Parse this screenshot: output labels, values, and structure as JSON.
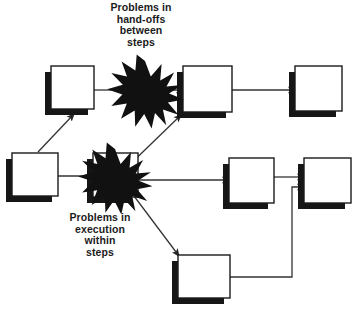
{
  "diagram": {
    "canvas": {
      "width": 359,
      "height": 312,
      "background": "#ffffff"
    },
    "style": {
      "box_fill": "#ffffff",
      "box_stroke": "#1a1a1a",
      "box_stroke_width": 1.4,
      "shadow_color": "#161616",
      "shadow_offset_x": -6,
      "shadow_offset_y": 6,
      "burst_fill": "#111111",
      "arrow_color": "#333333",
      "arrow_width": 1.3,
      "text_color": "#1b1b1b"
    },
    "captions": [
      {
        "id": "handoffs",
        "text": "Problems in\nhand-offs\nbetween\nsteps",
        "lines": [
          "Problems in",
          "hand-offs",
          "between",
          "steps"
        ],
        "x": 141,
        "y": 26
      },
      {
        "id": "execution",
        "text": "Problems in\nexecution\nwithin\nsteps",
        "lines": [
          "Problems in",
          "execution",
          "within",
          "steps"
        ],
        "x": 100,
        "y": 236
      }
    ],
    "boxes": [
      {
        "id": "step-1",
        "label": "",
        "x": 51,
        "y": 66,
        "width": 43,
        "height": 43
      },
      {
        "id": "step-2",
        "label": "",
        "x": 183,
        "y": 66,
        "width": 49,
        "height": 46
      },
      {
        "id": "step-3",
        "label": "",
        "x": 295,
        "y": 66,
        "width": 47,
        "height": 45
      },
      {
        "id": "step-4",
        "label": "",
        "x": 12,
        "y": 153,
        "width": 46,
        "height": 43
      },
      {
        "id": "step-5",
        "label": "",
        "x": 93,
        "y": 153,
        "width": 45,
        "height": 44
      },
      {
        "id": "step-6",
        "label": "",
        "x": 229,
        "y": 158,
        "width": 45,
        "height": 45
      },
      {
        "id": "step-7",
        "label": "",
        "x": 304,
        "y": 158,
        "width": 47,
        "height": 45
      },
      {
        "id": "step-8",
        "label": "",
        "x": 178,
        "y": 255,
        "width": 52,
        "height": 43
      }
    ],
    "bursts": [
      {
        "id": "burst-handoffs",
        "cx": 145,
        "cy": 93,
        "outer_radius": 32,
        "inner_radius": 15,
        "points": 14
      },
      {
        "id": "burst-execution",
        "cx": 115,
        "cy": 180,
        "outer_radius": 31,
        "inner_radius": 14,
        "points": 14
      }
    ],
    "connectors": [
      {
        "id": "arrow-step4-to-step1",
        "from": "step-4",
        "to": "step-1",
        "kind": "diagonal-up-right",
        "arrowhead": true
      },
      {
        "id": "arrow-step4-to-burst-execution",
        "from": "step-4",
        "to": "burst-execution",
        "kind": "horizontal",
        "arrowhead": true
      },
      {
        "id": "arrow-step1-to-burst-handoffs",
        "from": "step-1",
        "to": "burst-handoffs",
        "kind": "horizontal",
        "arrowhead": false
      },
      {
        "id": "arrow-burst-handoffs-to-step2",
        "from": "burst-handoffs",
        "to": "step-2",
        "kind": "horizontal",
        "arrowhead": true
      },
      {
        "id": "arrow-step2-to-step3",
        "from": "step-2",
        "to": "step-3",
        "kind": "horizontal",
        "arrowhead": true
      },
      {
        "id": "arrow-burst-execution-to-step2",
        "from": "burst-execution",
        "to": "step-2",
        "kind": "diagonal-up-right",
        "arrowhead": true
      },
      {
        "id": "arrow-burst-execution-to-step6",
        "from": "burst-execution",
        "to": "step-6",
        "kind": "horizontal",
        "arrowhead": true
      },
      {
        "id": "arrow-burst-execution-to-step8",
        "from": "burst-execution",
        "to": "step-8",
        "kind": "diagonal-down-right",
        "arrowhead": true
      },
      {
        "id": "arrow-step6-to-step7",
        "from": "step-6",
        "to": "step-7",
        "kind": "horizontal",
        "arrowhead": true
      },
      {
        "id": "arrow-step8-to-step7",
        "from": "step-8",
        "to": "step-7",
        "kind": "elbow-right-up",
        "arrowhead": true
      }
    ]
  }
}
